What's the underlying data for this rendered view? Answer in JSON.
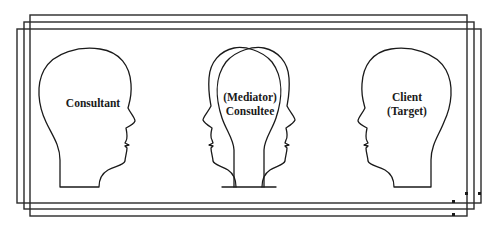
{
  "diagram": {
    "type": "consultation-triad",
    "nodes": [
      {
        "id": "consultant",
        "lines": [
          "Consultant"
        ],
        "facing": "right"
      },
      {
        "id": "consultee",
        "lines": [
          "(Mediator)",
          "Consultee"
        ],
        "facing": "both"
      },
      {
        "id": "client",
        "lines": [
          "Client",
          "(Target)"
        ],
        "facing": "left"
      }
    ],
    "frames": 3,
    "colors": {
      "stroke": "#1a1a1a",
      "background": "#ffffff"
    }
  }
}
